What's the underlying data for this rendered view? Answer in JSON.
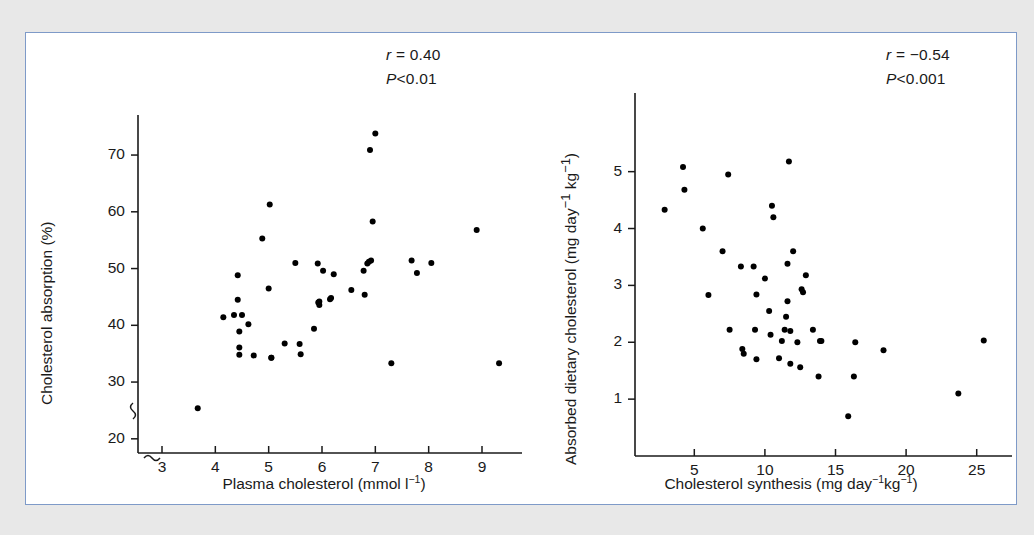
{
  "figure": {
    "border_color": "#7e9ac8",
    "background": "#ffffff",
    "page_background": "#e8e8e8",
    "point_color": "#000000",
    "axis_color": "#1a1a1a"
  },
  "chart_data": [
    {
      "type": "scatter",
      "panel": "left",
      "title": "",
      "xlabel": "Plasma cholesterol (mmol l⁻¹)",
      "ylabel": "Cholesterol absorption (%)",
      "xlabel_parts": {
        "text": "Plasma cholesterol (mmol l",
        "sup": "−1",
        "tail": ")"
      },
      "ylabel_parts": {
        "text": "Cholesterol absorption (%)"
      },
      "xlim": [
        2.55,
        9.75
      ],
      "ylim": [
        17.5,
        76
      ],
      "xticks": [
        3,
        4,
        5,
        6,
        7,
        8,
        9
      ],
      "yticks": [
        20,
        30,
        40,
        50,
        60,
        70
      ],
      "grid": false,
      "axis_break_y": true,
      "axis_break_x": true,
      "annotations": [
        {
          "name": "correlation",
          "symbol": "r",
          "relation": " = ",
          "value": "0.40"
        },
        {
          "name": "p-value",
          "symbol": "P",
          "relation": "<",
          "value": "0.01"
        }
      ],
      "n_points": 44,
      "x": [
        3.67,
        4.15,
        4.35,
        4.42,
        4.42,
        4.45,
        4.45,
        4.45,
        4.5,
        4.62,
        4.72,
        4.88,
        5.0,
        5.02,
        5.05,
        5.05,
        5.3,
        5.5,
        5.58,
        5.6,
        5.85,
        5.92,
        5.93,
        5.95,
        5.95,
        6.02,
        6.15,
        6.17,
        6.22,
        6.55,
        6.78,
        6.8,
        6.85,
        6.88,
        6.9,
        6.92,
        6.95,
        7.0,
        7.3,
        7.68,
        7.78,
        8.05,
        8.9,
        9.32
      ],
      "y": [
        25.4,
        41.4,
        41.8,
        48.8,
        44.5,
        38.9,
        36.1,
        34.8,
        41.8,
        40.2,
        34.7,
        55.3,
        46.5,
        61.3,
        34.3,
        34.3,
        36.8,
        51.0,
        36.7,
        34.9,
        39.4,
        50.9,
        44.0,
        44.2,
        43.6,
        49.6,
        44.6,
        44.8,
        49.0,
        46.2,
        49.6,
        45.4,
        50.9,
        51.2,
        70.9,
        51.4,
        58.3,
        73.8,
        33.3,
        51.4,
        49.2,
        51.0,
        56.8,
        33.3
      ]
    },
    {
      "type": "scatter",
      "panel": "right",
      "title": "",
      "xlabel": "Cholesterol synthesis (mg day⁻¹kg⁻¹)",
      "ylabel": "Absorbed dietary cholesterol (mg day⁻¹ kg⁻¹)",
      "xlabel_parts": {
        "text": "Cholesterol synthesis (mg day",
        "sup": "−1",
        "mid": "kg",
        "sup2": "−1",
        "tail": ")"
      },
      "ylabel_parts": {
        "text": "Absorbed dietary cholesterol (mg day",
        "sup": "−1",
        "mid": " kg",
        "sup2": "−1",
        "tail": ")"
      },
      "xlim": [
        0.8,
        27.5
      ],
      "ylim": [
        0.0,
        5.75
      ],
      "xticks": [
        5,
        10,
        15,
        20,
        25
      ],
      "yticks": [
        1,
        2,
        3,
        4,
        5
      ],
      "grid": false,
      "annotations": [
        {
          "name": "correlation",
          "symbol": "r",
          "relation": " = ",
          "value": "−0.54"
        },
        {
          "name": "p-value",
          "symbol": "P",
          "relation": "<",
          "value": "0.001"
        }
      ],
      "n_points": 44,
      "x": [
        2.9,
        4.2,
        4.3,
        5.6,
        6.0,
        7.0,
        7.4,
        7.5,
        8.3,
        8.4,
        8.5,
        9.2,
        9.3,
        9.4,
        9.4,
        10.0,
        10.3,
        10.4,
        10.5,
        10.6,
        11.0,
        11.2,
        11.4,
        11.5,
        11.6,
        11.6,
        11.7,
        11.8,
        11.8,
        12.0,
        12.3,
        12.5,
        12.6,
        12.7,
        12.9,
        13.4,
        13.8,
        13.9,
        14.0,
        15.9,
        16.3,
        16.4,
        18.4,
        23.7,
        25.5
      ],
      "y": [
        4.33,
        5.08,
        4.68,
        4.0,
        2.83,
        3.6,
        4.95,
        2.22,
        3.33,
        1.88,
        1.8,
        3.33,
        2.22,
        2.84,
        1.7,
        3.12,
        2.55,
        2.13,
        4.4,
        4.2,
        1.72,
        2.02,
        2.22,
        2.45,
        2.72,
        3.38,
        5.18,
        2.2,
        1.62,
        3.6,
        2.0,
        1.56,
        2.93,
        2.88,
        3.18,
        2.22,
        1.4,
        2.02,
        2.02,
        0.7,
        1.4,
        2.0,
        1.86,
        1.1,
        2.03
      ]
    }
  ]
}
